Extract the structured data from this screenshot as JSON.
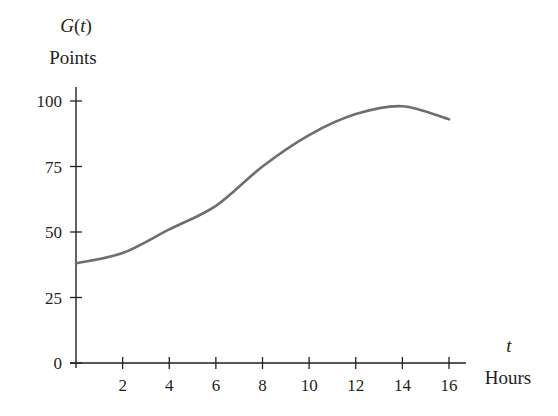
{
  "chart_data": {
    "type": "line",
    "title": "",
    "ylabel_function": "G(t)",
    "ylabel_units": "Points",
    "xlabel_variable": "t",
    "xlabel_units": "Hours",
    "x_ticks": [
      2,
      4,
      6,
      8,
      10,
      12,
      14,
      16
    ],
    "y_ticks": [
      0,
      25,
      50,
      75,
      100
    ],
    "xlim": [
      0,
      16
    ],
    "ylim": [
      0,
      100
    ],
    "grid": false,
    "legend": null,
    "series": [
      {
        "name": "G(t)",
        "x": [
          0,
          2,
          4,
          6,
          8,
          10,
          12,
          14,
          16
        ],
        "values": [
          38,
          42,
          51,
          60,
          75,
          87,
          95,
          98,
          93
        ]
      }
    ]
  },
  "colors": {
    "axis": "#231f20",
    "curve": "#6d6e70",
    "background": "#ffffff"
  }
}
